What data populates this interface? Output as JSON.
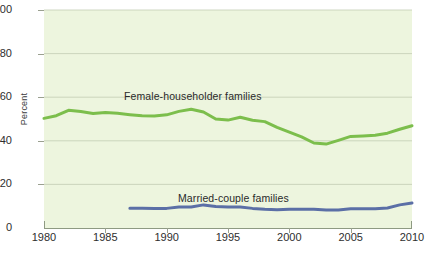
{
  "chart_data": {
    "type": "line",
    "title": "",
    "subtitle": "",
    "xlabel": "",
    "ylabel": "Percent",
    "xlim": [
      1980,
      2010
    ],
    "ylim": [
      0,
      100
    ],
    "grid": true,
    "legend_position": "inline-annotation",
    "x_ticks": [
      "1980",
      "1985",
      "1990",
      "1995",
      "2000",
      "2005",
      "2010"
    ],
    "y_ticks": [
      "0",
      "20",
      "40",
      "60",
      "80",
      "100"
    ],
    "background_color": "#edf5de",
    "series": [
      {
        "name": "Female-householder families",
        "color": "#7cbe4c",
        "label_x": 1990,
        "label_y": 64,
        "x": [
          1980,
          1981,
          1982,
          1983,
          1984,
          1985,
          1986,
          1987,
          1988,
          1989,
          1990,
          1991,
          1992,
          1993,
          1994,
          1995,
          1996,
          1997,
          1998,
          1999,
          2000,
          2001,
          2002,
          2003,
          2004,
          2005,
          2006,
          2007,
          2008,
          2009,
          2010
        ],
        "values": [
          50.3,
          51.5,
          54.0,
          53.4,
          52.5,
          53.0,
          52.6,
          52.0,
          51.5,
          51.4,
          51.9,
          53.5,
          54.5,
          53.2,
          50.0,
          49.5,
          50.8,
          49.4,
          48.8,
          46.2,
          44.0,
          41.8,
          39.0,
          38.5,
          40.2,
          42.0,
          42.2,
          42.5,
          43.5,
          45.3,
          46.9
        ]
      },
      {
        "name": "Married-couple families",
        "color": "#5b6fa6",
        "label_x": 1995,
        "label_y": 17,
        "x": [
          1987,
          1988,
          1989,
          1990,
          1991,
          1992,
          1993,
          1994,
          1995,
          1996,
          1997,
          1998,
          1999,
          2000,
          2001,
          2002,
          2003,
          2004,
          2005,
          2006,
          2007,
          2008,
          2009,
          2010
        ],
        "values": [
          9.1,
          9.1,
          9.0,
          9.0,
          9.6,
          9.6,
          10.6,
          9.9,
          9.6,
          9.6,
          9.0,
          8.6,
          8.4,
          8.6,
          8.6,
          8.6,
          8.3,
          8.3,
          8.8,
          8.8,
          8.8,
          9.2,
          10.6,
          11.5
        ]
      }
    ]
  },
  "axis": {
    "y_label": "Percent",
    "y_ticks": [
      {
        "value": 100,
        "label": "100"
      },
      {
        "value": 80,
        "label": "80"
      },
      {
        "value": 60,
        "label": "60"
      },
      {
        "value": 40,
        "label": "40"
      },
      {
        "value": 20,
        "label": "20"
      },
      {
        "value": 0,
        "label": "0"
      }
    ],
    "x_ticks": [
      {
        "value": 1980,
        "label": "1980"
      },
      {
        "value": 1985,
        "label": "1985"
      },
      {
        "value": 1990,
        "label": "1990"
      },
      {
        "value": 1995,
        "label": "1995"
      },
      {
        "value": 2000,
        "label": "2000"
      },
      {
        "value": 2005,
        "label": "2005"
      },
      {
        "value": 2010,
        "label": "2010"
      }
    ]
  },
  "annotations": {
    "female_label": "Female-householder families",
    "married_label": "Married-couple families"
  },
  "colors": {
    "plot_background": "#edf5de",
    "gridline": "#c3cdb4",
    "axis": "#8e9a82",
    "green_series": "#7cbe4c",
    "blue_series": "#5b6fa6",
    "text": "#2e2e2e"
  }
}
